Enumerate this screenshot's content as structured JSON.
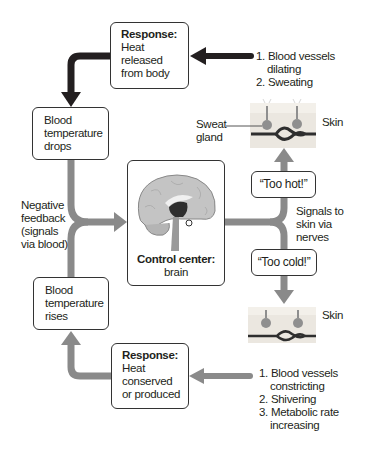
{
  "diagram": {
    "colors": {
      "hot_arrow": "#231f20",
      "cold_arrow": "#8a8a8a",
      "box_border": "#333333",
      "skin": "#e8e4dc",
      "vessel": "#2e2e2e"
    },
    "response_hot": {
      "heading": "Response:",
      "lines": [
        "Heat",
        "released",
        "from body"
      ]
    },
    "response_cold": {
      "heading": "Response:",
      "lines": [
        "Heat",
        "conserved",
        "or produced"
      ]
    },
    "state_drops": {
      "lines": [
        "Blood",
        "temperature",
        "drops"
      ]
    },
    "state_rises": {
      "lines": [
        "Blood",
        "temperature",
        "rises"
      ]
    },
    "control_center": {
      "heading": "Control center:",
      "sub": "brain",
      "icon": "brain-icon"
    },
    "feedback_label": {
      "lines": [
        "Negative",
        "feedback",
        "(signals",
        "via blood)"
      ]
    },
    "signals_label": {
      "lines": [
        "Signals to",
        "skin via",
        "nerves"
      ]
    },
    "too_hot": "“Too hot!”",
    "too_cold": "“Too cold!”",
    "hot_effects": [
      {
        "num": "1.",
        "text": "Blood vessels",
        "cont": "dilating"
      },
      {
        "num": "2.",
        "text": "Sweating"
      }
    ],
    "cold_effects": [
      {
        "num": "1.",
        "text": "Blood vessels",
        "cont": "constricting"
      },
      {
        "num": "2.",
        "text": "Shivering"
      },
      {
        "num": "3.",
        "text": "Metabolic rate",
        "cont": "increasing"
      }
    ],
    "skin_top_label": "Skin",
    "skin_bottom_label": "Skin",
    "sweat_gland_label": [
      "Sweat",
      "gland"
    ]
  }
}
